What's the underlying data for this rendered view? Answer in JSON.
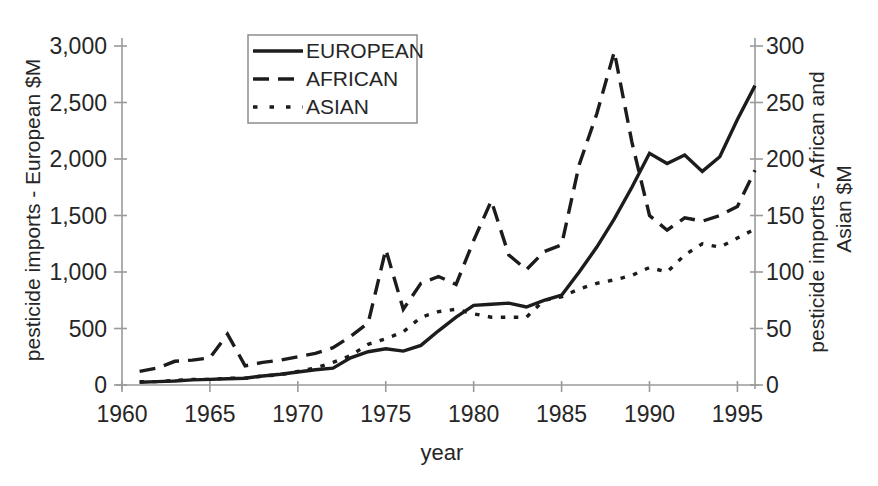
{
  "colors": {
    "background": "#ffffff",
    "line": "#1c1c1c",
    "axis": "#9a9a9a",
    "text": "#262626"
  },
  "chart_data": {
    "type": "line",
    "title": "",
    "xlabel": "year",
    "ylabel_left": "pesticide imports - European $M",
    "ylabel_right": "pesticide imports - African and Asian $M",
    "ylabel_right_lines": [
      "pesticide imports - African and",
      "Asian $M"
    ],
    "x_range": [
      1960,
      1996
    ],
    "x_ticks": [
      1960,
      1965,
      1970,
      1975,
      1980,
      1985,
      1990,
      1995
    ],
    "y_left": {
      "range": [
        0,
        3000
      ],
      "tick_values": [
        0,
        500,
        1000,
        1500,
        2000,
        2500,
        3000
      ],
      "tick_labels": [
        "0",
        "500",
        "1,000",
        "1,500",
        "2,000",
        "2,500",
        "3,000"
      ]
    },
    "y_right": {
      "range": [
        0,
        300
      ],
      "tick_values": [
        0,
        50,
        100,
        150,
        200,
        250,
        300
      ],
      "tick_labels": [
        "0",
        "50",
        "100",
        "150",
        "200",
        "250",
        "300"
      ]
    },
    "grid": false,
    "legend_position": "top-center",
    "years": [
      1961,
      1962,
      1963,
      1964,
      1965,
      1966,
      1967,
      1968,
      1969,
      1970,
      1971,
      1972,
      1973,
      1974,
      1975,
      1976,
      1977,
      1978,
      1979,
      1980,
      1981,
      1982,
      1983,
      1984,
      1985,
      1986,
      1987,
      1988,
      1989,
      1990,
      1991,
      1992,
      1993,
      1994,
      1995,
      1996
    ],
    "series": [
      {
        "name": "EUROPEAN",
        "axis": "left",
        "style": "solid",
        "values": [
          25,
          30,
          35,
          45,
          50,
          55,
          60,
          80,
          95,
          115,
          135,
          150,
          240,
          295,
          320,
          300,
          350,
          480,
          600,
          705,
          715,
          725,
          690,
          750,
          795,
          1000,
          1220,
          1470,
          1750,
          2050,
          1960,
          2035,
          1890,
          2020,
          2350,
          2650
        ]
      },
      {
        "name": "AFRICAN",
        "axis": "right",
        "style": "dashed",
        "values": [
          12,
          15,
          21,
          22,
          24,
          45,
          17,
          20,
          22,
          25,
          28,
          33,
          43,
          55,
          120,
          67,
          90,
          96,
          89,
          128,
          163,
          115,
          102,
          118,
          124,
          195,
          240,
          295,
          215,
          150,
          137,
          148,
          145,
          150,
          158,
          190
        ]
      },
      {
        "name": "ASIAN",
        "axis": "right",
        "style": "dotted",
        "values": [
          3,
          3,
          4,
          5,
          5,
          6,
          6,
          8,
          9,
          12,
          15,
          20,
          26,
          36,
          41,
          47,
          60,
          65,
          67,
          63,
          60,
          60,
          60,
          75,
          78,
          85,
          90,
          93,
          97,
          104,
          100,
          115,
          125,
          122,
          130,
          138
        ]
      }
    ]
  }
}
